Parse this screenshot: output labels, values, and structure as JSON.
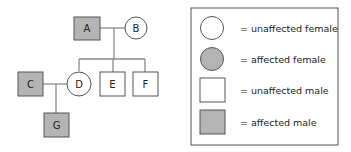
{
  "colors": {
    "affected_fill": "#b4b4b4",
    "unaffected_fill": "#ffffff",
    "stroke": "#555555",
    "line": "#8a8a8a"
  },
  "pedigree": {
    "individuals": [
      {
        "id": "A",
        "label": "A",
        "sex": "male",
        "affected": true,
        "generation": 1
      },
      {
        "id": "B",
        "label": "B",
        "sex": "female",
        "affected": false,
        "generation": 1
      },
      {
        "id": "C",
        "label": "C",
        "sex": "male",
        "affected": true,
        "generation": 2
      },
      {
        "id": "D",
        "label": "D",
        "sex": "female",
        "affected": false,
        "generation": 2
      },
      {
        "id": "E",
        "label": "E",
        "sex": "male",
        "affected": false,
        "generation": 2
      },
      {
        "id": "F",
        "label": "F",
        "sex": "male",
        "affected": false,
        "generation": 2
      },
      {
        "id": "G",
        "label": "G",
        "sex": "male",
        "affected": true,
        "generation": 3
      }
    ],
    "matings": [
      {
        "partners": [
          "A",
          "B"
        ],
        "children": [
          "D",
          "E",
          "F"
        ]
      },
      {
        "partners": [
          "C",
          "D"
        ],
        "children": [
          "G"
        ]
      }
    ]
  },
  "legend": {
    "items": [
      {
        "symbol": "circle",
        "affected": false,
        "label": "= unaffected female"
      },
      {
        "symbol": "circle",
        "affected": true,
        "label": "= affected female"
      },
      {
        "symbol": "square",
        "affected": false,
        "label": "= unaffected male"
      },
      {
        "symbol": "square",
        "affected": true,
        "label": "= affected male"
      }
    ]
  }
}
